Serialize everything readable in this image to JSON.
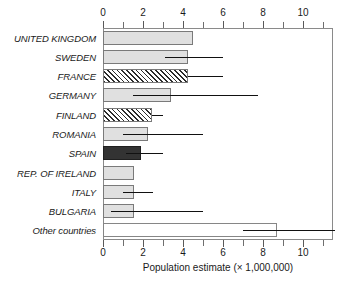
{
  "chart_data": {
    "type": "bar",
    "orientation": "horizontal",
    "title": "",
    "xlabel": "Population estimate (× 1,000,000)",
    "ylabel": "",
    "xlim": [
      0,
      11.5
    ],
    "grid": false,
    "legend": null,
    "axes": {
      "top_axis": true,
      "bottom_axis": true,
      "tick_interval": 1,
      "labeled_ticks": [
        0,
        2,
        4,
        6,
        8,
        10
      ],
      "tick_labels": [
        "0",
        "2",
        "4",
        "6",
        "8",
        "10"
      ],
      "all_ticks": [
        0,
        1,
        2,
        3,
        4,
        5,
        6,
        7,
        8,
        9,
        10,
        11
      ]
    },
    "categories": [
      "UNITED KINGDOM",
      "SWEDEN",
      "FRANCE",
      "GERMANY",
      "FINLAND",
      "ROMANIA",
      "SPAIN",
      "REP. OF IRELAND",
      "ITALY",
      "BULGARIA",
      "Other countries"
    ],
    "values": [
      4.5,
      4.25,
      4.25,
      3.4,
      2.45,
      2.25,
      1.9,
      1.55,
      1.55,
      1.55,
      8.7
    ],
    "error_low": [
      null,
      3.1,
      4.25,
      1.5,
      2.45,
      1.0,
      1.15,
      null,
      1.0,
      0.4,
      7.0
    ],
    "error_high": [
      null,
      6.0,
      6.0,
      7.75,
      3.0,
      5.0,
      3.0,
      null,
      2.5,
      5.0,
      11.6
    ],
    "bar_styles": [
      "light-gray",
      "light-gray",
      "hatched",
      "light-gray",
      "hatched",
      "light-gray",
      "dark",
      "light-gray",
      "light-gray",
      "light-gray",
      "white"
    ],
    "colors": {
      "light-gray": "#e0e0e0",
      "hatched": "#ffffff",
      "dark": "#333333",
      "white": "#ffffff",
      "bar_outline": "#7a7a7a",
      "error_bar": "#111111",
      "frame": "#8a8a8a",
      "text": "#1a1a1a",
      "background": "#ffffff"
    }
  }
}
